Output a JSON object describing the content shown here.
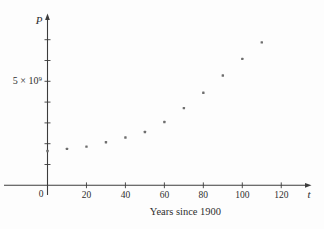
{
  "figure": {
    "y_axis_label": "P",
    "x_axis_label": "t",
    "origin_label": "0",
    "y_tick_label": "5 × 10⁹",
    "x_title": "Years since 1900",
    "colors": {
      "background": "#fdfdfd",
      "axis": "#3c3c3c",
      "text": "#2e2e2e",
      "point": "#6e6e6e"
    }
  },
  "chart_data": {
    "type": "scatter",
    "title": "",
    "xlabel": "Years since 1900",
    "ylabel": "P",
    "x": [
      0,
      10,
      20,
      30,
      40,
      50,
      60,
      70,
      80,
      90,
      100,
      110
    ],
    "y_population_billions": [
      1.65,
      1.75,
      1.86,
      2.07,
      2.3,
      2.56,
      3.04,
      3.71,
      4.45,
      5.28,
      6.08,
      6.87
    ],
    "x_ticks": [
      20,
      40,
      60,
      80,
      100,
      120
    ],
    "y_ticks_billions": [
      1,
      2,
      3,
      4,
      5,
      6,
      7
    ],
    "y_tick_labeled": {
      "value_billions": 5,
      "label": "5 × 10⁹"
    },
    "xlim": [
      0,
      133
    ],
    "ylim_billions": [
      0,
      7.6
    ],
    "grid": false,
    "legend": null
  }
}
